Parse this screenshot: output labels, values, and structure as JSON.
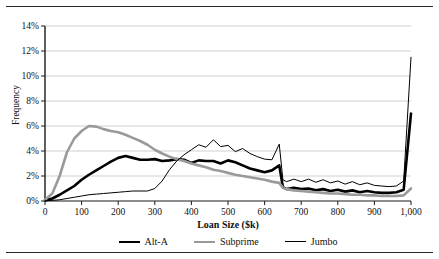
{
  "chart_data": {
    "type": "line",
    "title": "",
    "xlabel": "Loan Size ($k)",
    "ylabel": "Frequency",
    "xlim": [
      0,
      1000
    ],
    "ylim": [
      0,
      14
    ],
    "grid": "horizontal",
    "legend_position": "bottom",
    "x_tick_labels": [
      "0",
      "100",
      "200",
      "300",
      "400",
      "500",
      "600",
      "700",
      "800",
      "900",
      "1,000"
    ],
    "x_ticks": [
      0,
      100,
      200,
      300,
      400,
      500,
      600,
      700,
      800,
      900,
      1000
    ],
    "y_tick_labels": [
      "0%",
      "2%",
      "4%",
      "6%",
      "8%",
      "10%",
      "12%",
      "14%"
    ],
    "y_ticks": [
      0,
      2,
      4,
      6,
      8,
      10,
      12,
      14
    ],
    "x": [
      0,
      20,
      40,
      60,
      80,
      100,
      120,
      140,
      160,
      180,
      200,
      220,
      240,
      260,
      280,
      300,
      320,
      340,
      360,
      380,
      400,
      420,
      440,
      460,
      480,
      500,
      520,
      540,
      560,
      580,
      600,
      620,
      640,
      650,
      660,
      680,
      700,
      720,
      740,
      760,
      780,
      800,
      820,
      840,
      860,
      880,
      900,
      920,
      940,
      960,
      980,
      1000
    ],
    "series": [
      {
        "name": "Alt-A",
        "color": "#000000",
        "width": 2.6,
        "values": [
          0.05,
          0.2,
          0.5,
          0.85,
          1.2,
          1.7,
          2.1,
          2.45,
          2.8,
          3.15,
          3.45,
          3.6,
          3.45,
          3.3,
          3.3,
          3.35,
          3.2,
          3.25,
          3.35,
          3.3,
          3.05,
          3.25,
          3.2,
          3.2,
          3.0,
          3.25,
          3.1,
          2.85,
          2.6,
          2.45,
          2.3,
          2.45,
          2.85,
          1.1,
          0.95,
          1.05,
          0.95,
          1.0,
          0.85,
          0.95,
          0.8,
          0.9,
          0.75,
          0.85,
          0.7,
          0.8,
          0.7,
          0.65,
          0.65,
          0.7,
          0.9,
          7.0
        ]
      },
      {
        "name": "Subprime",
        "color": "#9a9a9a",
        "width": 2.6,
        "values": [
          0.1,
          0.6,
          2.0,
          3.9,
          5.0,
          5.6,
          6.0,
          5.95,
          5.75,
          5.6,
          5.5,
          5.3,
          5.05,
          4.8,
          4.5,
          4.1,
          3.8,
          3.55,
          3.35,
          3.2,
          3.0,
          2.85,
          2.7,
          2.5,
          2.4,
          2.25,
          2.1,
          2.0,
          1.9,
          1.8,
          1.7,
          1.55,
          1.45,
          1.05,
          0.95,
          0.85,
          0.8,
          0.75,
          0.7,
          0.65,
          0.6,
          0.6,
          0.55,
          0.5,
          0.5,
          0.45,
          0.45,
          0.4,
          0.4,
          0.4,
          0.45,
          1.0
        ]
      },
      {
        "name": "Jumbo",
        "color": "#000000",
        "width": 1.0,
        "values": [
          0.02,
          0.05,
          0.1,
          0.2,
          0.3,
          0.4,
          0.5,
          0.55,
          0.6,
          0.65,
          0.7,
          0.75,
          0.8,
          0.8,
          0.8,
          1.0,
          1.6,
          2.5,
          3.2,
          3.7,
          4.1,
          4.5,
          4.3,
          4.9,
          4.35,
          4.45,
          3.95,
          4.2,
          3.8,
          3.55,
          3.35,
          3.3,
          4.55,
          1.7,
          1.55,
          1.75,
          1.55,
          1.75,
          1.5,
          1.7,
          1.45,
          1.6,
          1.35,
          1.55,
          1.3,
          1.45,
          1.25,
          1.2,
          1.15,
          1.2,
          1.6,
          11.5
        ]
      }
    ]
  },
  "axis": {
    "y_title": "Frequency",
    "x_title": "Loan Size ($k)"
  },
  "legend": {
    "items": [
      {
        "label": "Alt-A"
      },
      {
        "label": "Subprime"
      },
      {
        "label": "Jumbo"
      }
    ]
  }
}
